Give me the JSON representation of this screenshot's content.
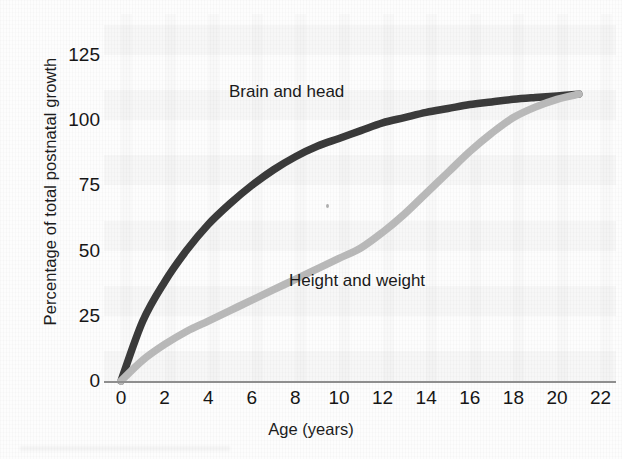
{
  "chart_data": {
    "type": "line",
    "title": "",
    "xlabel": "Age (years)",
    "ylabel": "Percentage of total postnatal growth",
    "xlim": [
      -1,
      23
    ],
    "ylim": [
      0,
      131
    ],
    "xticks": [
      "0",
      "2",
      "4",
      "6",
      "8",
      "10",
      "12",
      "14",
      "16",
      "18",
      "20",
      "22"
    ],
    "xtick_values": [
      0,
      2,
      4,
      6,
      8,
      10,
      12,
      14,
      16,
      18,
      20,
      22
    ],
    "yticks": [
      "0",
      "25",
      "50",
      "75",
      "100",
      "125"
    ],
    "ytick_values": [
      0,
      25,
      50,
      75,
      100,
      125
    ],
    "grid": "faint-background-bands",
    "legend": "inline-curve-labels",
    "x": [
      0,
      1,
      2,
      3,
      4,
      5,
      6,
      7,
      8,
      9,
      10,
      11,
      12,
      13,
      14,
      15,
      16,
      17,
      18,
      19,
      20,
      21
    ],
    "series": [
      {
        "name": "Brain and head",
        "color": "#3a3a3a",
        "label_x": 6.5,
        "label_y": 103,
        "values": [
          0,
          23,
          38,
          50,
          60,
          68,
          75,
          81,
          86,
          90,
          93,
          96,
          99,
          101,
          103,
          104.5,
          106,
          107,
          108,
          108.7,
          109.3,
          110
        ]
      },
      {
        "name": "Height and weight",
        "color": "#b8b8b8",
        "label_x": 9.0,
        "label_y": 32,
        "values": [
          0,
          8,
          14,
          19,
          23,
          27,
          31,
          35,
          39,
          43,
          47,
          51,
          57,
          64,
          72,
          80,
          88,
          95,
          101,
          105,
          108,
          110
        ]
      }
    ]
  }
}
